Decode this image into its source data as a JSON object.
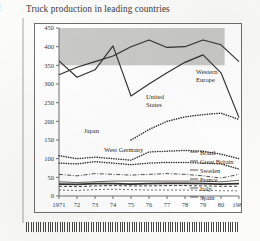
{
  "figure": {
    "title": "Truck production in leading countries",
    "ylabel": "'000 Units (more than 6 tons gross weight)"
  },
  "annotations": {
    "western_europe_l1": "Western",
    "western_europe_l2": "Europe",
    "united_states_l1": "United",
    "united_states_l2": "States",
    "japan": "Japan",
    "west_germany": "West Germany",
    "brazil": "Brazil",
    "great_britain": "Great Britain",
    "sweden": "Sweden",
    "france": "France",
    "italy": "Italy",
    "spain": "Spain"
  },
  "colors": {
    "line": "#33312f",
    "axis": "#6e6e6e",
    "shade": "#c9c9c7",
    "page": "#fbfbfa"
  },
  "chart_data": {
    "type": "line",
    "title": "Truck production in leading countries",
    "xlabel": "",
    "ylabel": "'000 Units (more than 6 tons gross weight)",
    "xlim": [
      1971,
      1981
    ],
    "ylim": [
      0,
      450
    ],
    "yticks": [
      0,
      50,
      100,
      150,
      200,
      250,
      300,
      350,
      400,
      450
    ],
    "ytick_labels": [
      "0",
      "50",
      "100",
      "150",
      "200",
      "250",
      "300",
      "350",
      "400",
      "450"
    ],
    "xticks": [
      1971,
      1972,
      1973,
      1974,
      1975,
      1976,
      1977,
      1978,
      1979,
      1980,
      1981
    ],
    "xtick_labels": [
      "1971",
      "72",
      "73",
      "74",
      "75",
      "76",
      "77",
      "78",
      "79",
      "80",
      "1981"
    ],
    "grid": false,
    "legend": "inline-labels",
    "shaded_band": {
      "y_from": 350,
      "y_to": 450,
      "x_from": 1971,
      "x_to": 1980.2
    },
    "series": [
      {
        "name": "Western Europe",
        "style": "solid",
        "label_position": "right",
        "x": [
          1971,
          1972,
          1973,
          1974,
          1975,
          1976,
          1977,
          1978,
          1979,
          1980,
          1981
        ],
        "values": [
          325,
          345,
          360,
          375,
          400,
          418,
          398,
          400,
          418,
          405,
          360
        ]
      },
      {
        "name": "United States",
        "style": "solid",
        "label_position": "inside",
        "x": [
          1971,
          1972,
          1973,
          1974,
          1975,
          1976,
          1977,
          1978,
          1979,
          1980,
          1981
        ],
        "values": [
          362,
          318,
          338,
          402,
          268,
          300,
          330,
          358,
          378,
          330,
          210
        ]
      },
      {
        "name": "Japan",
        "style": "dotted",
        "label_position": "inside",
        "x": [
          1975,
          1976,
          1977,
          1978,
          1979,
          1980,
          1981
        ],
        "values": [
          150,
          178,
          200,
          212,
          218,
          222,
          205
        ]
      },
      {
        "name": "West Germany",
        "style": "dotted",
        "label_position": "inside",
        "x": [
          1971,
          1972,
          1973,
          1974,
          1975,
          1976,
          1977,
          1978,
          1979,
          1980,
          1981
        ],
        "values": [
          108,
          100,
          104,
          100,
          96,
          118,
          120,
          122,
          120,
          112,
          100
        ]
      },
      {
        "name": "Brazil",
        "style": "dotted",
        "label_position": "right",
        "x": [
          1971,
          1972,
          1973,
          1974,
          1975,
          1976,
          1977,
          1978,
          1979,
          1980,
          1981
        ],
        "values": [
          88,
          86,
          92,
          88,
          84,
          88,
          90,
          90,
          88,
          86,
          72
        ]
      },
      {
        "name": "Great Britain",
        "style": "dashdot",
        "label_position": "right",
        "x": [
          1971,
          1972,
          1973,
          1974,
          1975,
          1976,
          1977,
          1978,
          1979,
          1980,
          1981
        ],
        "values": [
          58,
          54,
          60,
          58,
          56,
          58,
          60,
          58,
          54,
          48,
          58
        ]
      },
      {
        "name": "Sweden",
        "style": "solid-thin",
        "label_position": "right",
        "x": [
          1971,
          1972,
          1973,
          1974,
          1975,
          1976,
          1977,
          1978,
          1979,
          1980,
          1981
        ],
        "values": [
          38,
          36,
          38,
          40,
          40,
          40,
          40,
          40,
          40,
          38,
          42
        ]
      },
      {
        "name": "France",
        "style": "solid-bold",
        "label_position": "right",
        "x": [
          1971,
          1972,
          1973,
          1974,
          1975,
          1976,
          1977,
          1978,
          1979,
          1980,
          1981
        ],
        "values": [
          32,
          31,
          33,
          33,
          32,
          33,
          34,
          34,
          33,
          32,
          33
        ]
      },
      {
        "name": "Italy",
        "style": "dashed",
        "label_position": "right",
        "x": [
          1971,
          1972,
          1973,
          1974,
          1975,
          1976,
          1977,
          1978,
          1979,
          1980,
          1981
        ],
        "values": [
          26,
          25,
          27,
          28,
          27,
          27,
          28,
          28,
          27,
          26,
          26
        ]
      },
      {
        "name": "Spain",
        "style": "dashed-fine",
        "label_position": "right",
        "x": [
          1971,
          1972,
          1973,
          1974,
          1975,
          1976,
          1977,
          1978,
          1979,
          1980,
          1981
        ],
        "values": [
          16,
          15,
          17,
          18,
          17,
          16,
          16,
          16,
          15,
          14,
          14
        ]
      }
    ]
  }
}
